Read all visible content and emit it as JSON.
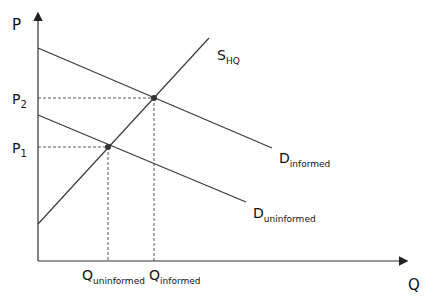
{
  "diagram": {
    "axes": {
      "y_label": "P",
      "x_label": "Q"
    },
    "price_ticks": [
      {
        "label_main": "P",
        "label_sub": "2",
        "y": 98
      },
      {
        "label_main": "P",
        "label_sub": "1",
        "y": 147
      }
    ],
    "quantity_ticks": [
      {
        "label_main": "Q",
        "label_sub": "uninformed",
        "x": 108
      },
      {
        "label_main": "Q",
        "label_sub": "informed",
        "x": 154
      }
    ],
    "curves": [
      {
        "name": "supply",
        "label_main": "S",
        "label_sub": "HQ",
        "from": [
          38,
          224
        ],
        "to": [
          209,
          38
        ]
      },
      {
        "name": "demand-informed",
        "label_main": "D",
        "label_sub": "informed",
        "from": [
          38,
          48
        ],
        "to": [
          272,
          148
        ]
      },
      {
        "name": "demand-uninformed",
        "label_main": "D",
        "label_sub": "uninformed",
        "from": [
          38,
          115
        ],
        "to": [
          246,
          202
        ]
      }
    ],
    "equilibria": [
      {
        "name": "equilibrium-uninformed",
        "x": 108,
        "y": 147,
        "price": "P1",
        "quantity": "Q_uninformed"
      },
      {
        "name": "equilibrium-informed",
        "x": 154,
        "y": 98,
        "price": "P2",
        "quantity": "Q_informed"
      }
    ],
    "colors": {
      "line": "#3a3a3a",
      "point": "#333333"
    }
  }
}
